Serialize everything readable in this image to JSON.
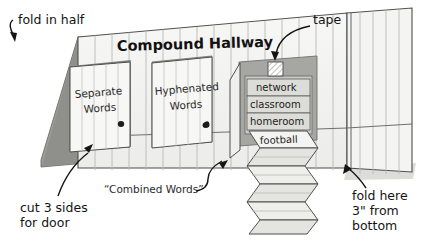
{
  "figure": {
    "header_label": "Compound Hallway"
  },
  "colors": {
    "paper": "#f0f0ee",
    "paper_light": "#f6f6f4",
    "panel_shade": "#d6d6d2",
    "fold_dark": "#7e7e7a",
    "door_frame": "#9a9a96",
    "recess_gray": "#a8a8a4",
    "wordbox": "#c9c9c5",
    "line": "#5a5a58",
    "ink": "#141414",
    "shadow": "#d2d2ce"
  },
  "doors": [
    {
      "id": "separate",
      "line1": "Separate",
      "line2": "Words"
    },
    {
      "id": "hyphenated",
      "line1": "Hyphenated",
      "line2": "Words"
    }
  ],
  "word_list": {
    "items": [
      "network",
      "classroom",
      "homeroom"
    ],
    "flap_word": "football"
  },
  "annotations": {
    "fold_in_half": "fold in half",
    "tape": "tape",
    "cut_door_line1": "cut 3 sides",
    "cut_door_line2": "for door",
    "combined_words": "“Combined Words”",
    "fold_here_line1": "fold here",
    "fold_here_line2": "3\" from",
    "fold_here_line3": "bottom"
  }
}
